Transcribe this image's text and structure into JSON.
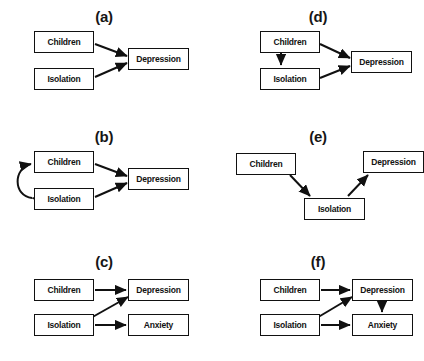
{
  "figure": {
    "title_fragment": "",
    "background_color": "#ffffff",
    "line_color": "#111111",
    "text_color": "#121212",
    "node_labels": {
      "children": "Children",
      "isolation": "Isolation",
      "depression": "Depression",
      "anxiety": "Anxiety"
    },
    "panels": [
      {
        "id": "a",
        "label": "(a)",
        "nodes": [
          {
            "name": "children",
            "text": "Children"
          },
          {
            "name": "isolation",
            "text": "Isolation"
          },
          {
            "name": "depression",
            "text": "Depression"
          }
        ],
        "edges": [
          {
            "from": "children",
            "to": "depression",
            "style": "straight-arrow"
          },
          {
            "from": "isolation",
            "to": "depression",
            "style": "straight-arrow"
          }
        ]
      },
      {
        "id": "b",
        "label": "(b)",
        "nodes": [
          {
            "name": "children",
            "text": "Children"
          },
          {
            "name": "isolation",
            "text": "Isolation"
          },
          {
            "name": "depression",
            "text": "Depression"
          }
        ],
        "edges": [
          {
            "from": "children",
            "to": "depression",
            "style": "straight-arrow"
          },
          {
            "from": "isolation",
            "to": "depression",
            "style": "straight-arrow"
          },
          {
            "from": "isolation",
            "to": "children",
            "style": "curved-double-arrow"
          }
        ]
      },
      {
        "id": "c",
        "label": "(c)",
        "nodes": [
          {
            "name": "children",
            "text": "Children"
          },
          {
            "name": "isolation",
            "text": "Isolation"
          },
          {
            "name": "depression",
            "text": "Depression"
          },
          {
            "name": "anxiety",
            "text": "Anxiety"
          }
        ],
        "edges": [
          {
            "from": "children",
            "to": "depression",
            "style": "straight-arrow"
          },
          {
            "from": "isolation",
            "to": "anxiety",
            "style": "straight-arrow"
          },
          {
            "from": "isolation",
            "to": "depression",
            "style": "straight-arrow"
          }
        ]
      },
      {
        "id": "d",
        "label": "(d)",
        "nodes": [
          {
            "name": "children",
            "text": "Children"
          },
          {
            "name": "isolation",
            "text": "Isolation"
          },
          {
            "name": "depression",
            "text": "Depression"
          }
        ],
        "edges": [
          {
            "from": "children",
            "to": "depression",
            "style": "straight-arrow"
          },
          {
            "from": "children",
            "to": "isolation",
            "style": "straight-arrow"
          },
          {
            "from": "isolation",
            "to": "depression",
            "style": "straight-arrow"
          }
        ]
      },
      {
        "id": "e",
        "label": "(e)",
        "nodes": [
          {
            "name": "children",
            "text": "Children"
          },
          {
            "name": "depression",
            "text": "Depression"
          },
          {
            "name": "isolation",
            "text": "Isolation"
          }
        ],
        "edges": [
          {
            "from": "children",
            "to": "isolation",
            "style": "straight-arrow"
          },
          {
            "from": "isolation",
            "to": "depression",
            "style": "straight-arrow"
          }
        ]
      },
      {
        "id": "f",
        "label": "(f)",
        "nodes": [
          {
            "name": "children",
            "text": "Children"
          },
          {
            "name": "isolation",
            "text": "Isolation"
          },
          {
            "name": "depression",
            "text": "Depression"
          },
          {
            "name": "anxiety",
            "text": "Anxiety"
          }
        ],
        "edges": [
          {
            "from": "children",
            "to": "depression",
            "style": "straight-arrow"
          },
          {
            "from": "isolation",
            "to": "anxiety",
            "style": "straight-arrow"
          },
          {
            "from": "isolation",
            "to": "depression",
            "style": "straight-arrow"
          },
          {
            "from": "depression",
            "to": "anxiety",
            "style": "straight-arrow"
          }
        ]
      }
    ]
  }
}
